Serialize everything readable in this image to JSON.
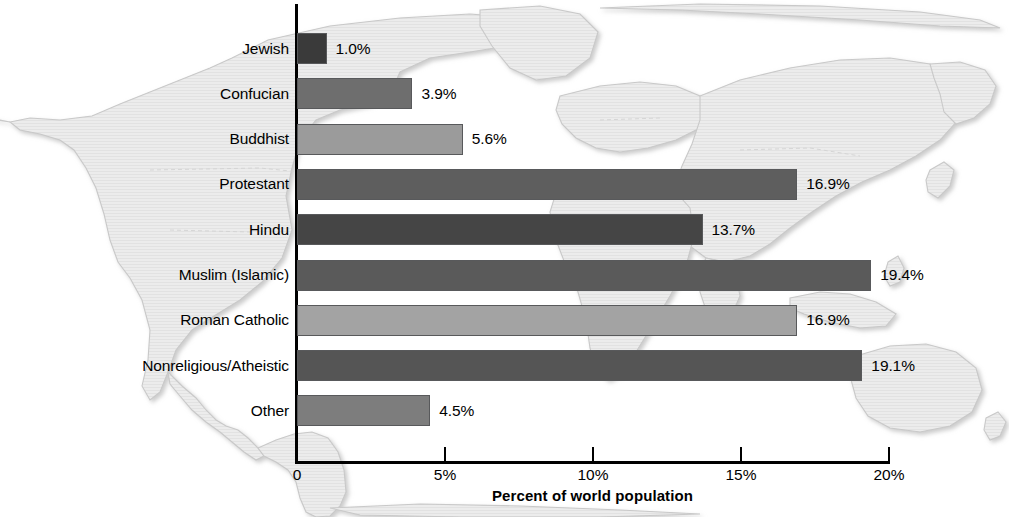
{
  "chart_data": {
    "type": "bar",
    "orientation": "horizontal",
    "title": "",
    "xlabel": "Percent of world population",
    "ylabel": "",
    "xlim": [
      0,
      20
    ],
    "grid": false,
    "legend": null,
    "background_image": "world-map-watermark",
    "categories": [
      "Jewish",
      "Confucian",
      "Buddhist",
      "Protestant",
      "Hindu",
      "Muslim (Islamic)",
      "Roman Catholic",
      "Nonreligious/Atheistic",
      "Other"
    ],
    "values": [
      1.0,
      3.9,
      5.6,
      16.9,
      13.7,
      19.4,
      16.9,
      19.1,
      4.5
    ],
    "value_labels": [
      "1.0%",
      "3.9%",
      "5.6%",
      "16.9%",
      "13.7%",
      "19.4%",
      "16.9%",
      "19.1%",
      "4.5%"
    ],
    "bar_colors": [
      "#3a3a3a",
      "#6e6e6e",
      "#9b9b9b",
      "#5e5e5e",
      "#454545",
      "#5a5a5a",
      "#a3a3a3",
      "#555555",
      "#7d7d7d"
    ],
    "bar_edge_color": "#58595b",
    "xticks": [
      0,
      5,
      10,
      15,
      20
    ],
    "xtick_labels": [
      "0",
      "5%",
      "10%",
      "15%",
      "20%"
    ],
    "axis_color": "#000000"
  }
}
